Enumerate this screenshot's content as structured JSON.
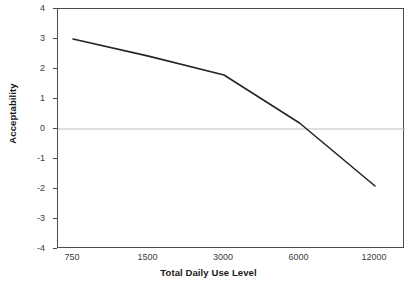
{
  "chart_data": {
    "type": "line",
    "title": "",
    "subtitle": "",
    "xlabel": "Total Daily Use Level",
    "ylabel": "Acceptability",
    "categories": [
      "750",
      "1500",
      "3000",
      "6000",
      "12000"
    ],
    "values": [
      3.0,
      2.43,
      1.8,
      0.2,
      -1.9
    ],
    "series": [
      {
        "name": "Acceptability",
        "values": [
          3.0,
          2.43,
          1.8,
          0.2,
          -1.9
        ],
        "color": "#262626"
      }
    ],
    "ylim": [
      -4,
      4
    ],
    "ytick_labels": [
      "4",
      "3",
      "2",
      "1",
      "0",
      "-1",
      "-2",
      "-3",
      "-4"
    ],
    "ytick_values": [
      4,
      3,
      2,
      1,
      0,
      -1,
      -2,
      -3,
      -4
    ],
    "grid": false,
    "zero_line": true,
    "zero_line_color": "#bfbfbf",
    "legend": "none",
    "axis_color": "#4d4d4d",
    "background": "#ffffff"
  }
}
